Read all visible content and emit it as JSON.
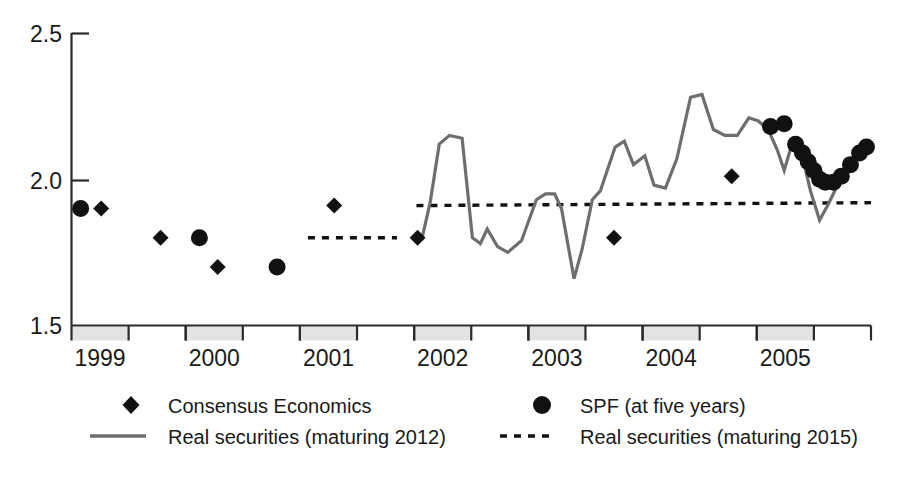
{
  "chart_data": {
    "type": "line",
    "title": "",
    "xlabel": "",
    "ylabel": "",
    "ylim": [
      1.5,
      2.5
    ],
    "yticks": [
      1.5,
      2.0,
      2.5
    ],
    "ytick_labels": [
      "1.5",
      "2.0",
      "2.5"
    ],
    "xlim": [
      1998.5,
      2005.5
    ],
    "xtick_labels": [
      "1999",
      "2000",
      "2001",
      "2002",
      "2003",
      "2004",
      "2005"
    ],
    "grid": false,
    "legend_position": "below-plot-two-columns",
    "axis_bands": "alternating grey half-year shading on x-axis",
    "series": [
      {
        "name": "Consensus Economics",
        "marker": "diamond",
        "color": "#111111",
        "points": [
          {
            "x": 1998.76,
            "y": 1.9
          },
          {
            "x": 1999.28,
            "y": 1.8
          },
          {
            "x": 1999.78,
            "y": 1.7
          },
          {
            "x": 2000.8,
            "y": 1.91
          },
          {
            "x": 2001.53,
            "y": 1.8
          },
          {
            "x": 2003.25,
            "y": 1.8
          },
          {
            "x": 2004.28,
            "y": 2.01
          }
        ]
      },
      {
        "name": "SPF (at five years)",
        "marker": "circle",
        "color": "#111111",
        "points": [
          {
            "x": 1998.58,
            "y": 1.9
          },
          {
            "x": 1999.62,
            "y": 1.8
          },
          {
            "x": 2000.3,
            "y": 1.7
          },
          {
            "x": 2004.62,
            "y": 2.18
          },
          {
            "x": 2004.74,
            "y": 2.19
          },
          {
            "x": 2004.84,
            "y": 2.12
          },
          {
            "x": 2004.9,
            "y": 2.09
          },
          {
            "x": 2004.95,
            "y": 2.06
          },
          {
            "x": 2005.0,
            "y": 2.03
          },
          {
            "x": 2005.05,
            "y": 2.0
          },
          {
            "x": 2005.1,
            "y": 1.99
          },
          {
            "x": 2005.17,
            "y": 1.99
          },
          {
            "x": 2005.24,
            "y": 2.01
          },
          {
            "x": 2005.32,
            "y": 2.05
          },
          {
            "x": 2005.4,
            "y": 2.09
          },
          {
            "x": 2005.46,
            "y": 2.11
          }
        ]
      },
      {
        "name": "Real securities (maturing 2012)",
        "marker": "none",
        "style": "solid",
        "color": "#6e6e6e",
        "points": [
          {
            "x": 2001.52,
            "y": 1.82
          },
          {
            "x": 2001.57,
            "y": 1.8
          },
          {
            "x": 2001.64,
            "y": 1.92
          },
          {
            "x": 2001.72,
            "y": 2.12
          },
          {
            "x": 2001.81,
            "y": 2.15
          },
          {
            "x": 2001.92,
            "y": 2.14
          },
          {
            "x": 2002.01,
            "y": 1.8
          },
          {
            "x": 2002.08,
            "y": 1.78
          },
          {
            "x": 2002.14,
            "y": 1.83
          },
          {
            "x": 2002.23,
            "y": 1.77
          },
          {
            "x": 2002.32,
            "y": 1.75
          },
          {
            "x": 2002.44,
            "y": 1.79
          },
          {
            "x": 2002.57,
            "y": 1.93
          },
          {
            "x": 2002.65,
            "y": 1.95
          },
          {
            "x": 2002.73,
            "y": 1.95
          },
          {
            "x": 2002.79,
            "y": 1.9
          },
          {
            "x": 2002.9,
            "y": 1.66
          },
          {
            "x": 2002.97,
            "y": 1.76
          },
          {
            "x": 2003.06,
            "y": 1.93
          },
          {
            "x": 2003.13,
            "y": 1.96
          },
          {
            "x": 2003.26,
            "y": 2.11
          },
          {
            "x": 2003.34,
            "y": 2.13
          },
          {
            "x": 2003.42,
            "y": 2.05
          },
          {
            "x": 2003.52,
            "y": 2.08
          },
          {
            "x": 2003.6,
            "y": 1.98
          },
          {
            "x": 2003.7,
            "y": 1.97
          },
          {
            "x": 2003.8,
            "y": 2.07
          },
          {
            "x": 2003.92,
            "y": 2.28
          },
          {
            "x": 2004.02,
            "y": 2.29
          },
          {
            "x": 2004.12,
            "y": 2.17
          },
          {
            "x": 2004.22,
            "y": 2.15
          },
          {
            "x": 2004.33,
            "y": 2.15
          },
          {
            "x": 2004.43,
            "y": 2.21
          },
          {
            "x": 2004.51,
            "y": 2.2
          },
          {
            "x": 2004.6,
            "y": 2.17
          },
          {
            "x": 2004.68,
            "y": 2.1
          },
          {
            "x": 2004.74,
            "y": 2.03
          },
          {
            "x": 2004.8,
            "y": 2.11
          },
          {
            "x": 2004.88,
            "y": 2.11
          },
          {
            "x": 2004.97,
            "y": 1.96
          },
          {
            "x": 2005.05,
            "y": 1.86
          },
          {
            "x": 2005.12,
            "y": 1.91
          },
          {
            "x": 2005.22,
            "y": 1.99
          },
          {
            "x": 2005.32,
            "y": 2.05
          },
          {
            "x": 2005.42,
            "y": 2.11
          },
          {
            "x": 2005.5,
            "y": 2.1
          }
        ]
      },
      {
        "name": "Real securities (maturing 2015)",
        "marker": "none",
        "style": "dashed",
        "color": "#111111",
        "segments": [
          {
            "from": {
              "x": 2000.57,
              "y": 1.8
            },
            "to": {
              "x": 2001.35,
              "y": 1.8
            }
          },
          {
            "from": {
              "x": 2001.52,
              "y": 1.91
            },
            "to": {
              "x": 2005.5,
              "y": 1.92
            }
          }
        ]
      }
    ]
  },
  "axis": {
    "y_tick_labels": [
      "2.5",
      "2.0",
      "1.5"
    ],
    "x_tick_labels": [
      "1999",
      "2000",
      "2001",
      "2002",
      "2003",
      "2004",
      "2005"
    ]
  },
  "legend": {
    "items": [
      {
        "symbol": "diamond-marker",
        "label": "Consensus Economics"
      },
      {
        "symbol": "circle-marker",
        "label": "SPF (at five years)"
      },
      {
        "symbol": "solid-line-swatch",
        "label": "Real securities (maturing 2012)"
      },
      {
        "symbol": "dashed-line-swatch",
        "label": "Real securities (maturing 2015)"
      }
    ]
  },
  "colors": {
    "solid_series": "#6e6e6e",
    "dashed_series": "#111111",
    "marker": "#111111",
    "axis": "#2b2b2b",
    "band": "#e3e3e3",
    "background": "#ffffff"
  }
}
